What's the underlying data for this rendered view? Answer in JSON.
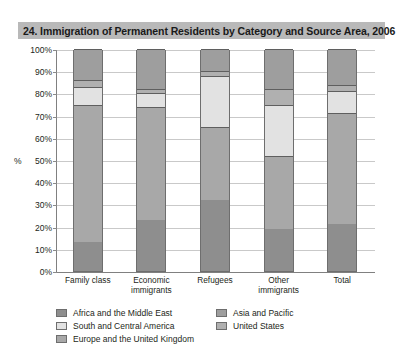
{
  "title": "24. Immigration of Permanent Residents by Category and Source Area, 2006",
  "axis": {
    "unit_label": "%",
    "y_ticks": [
      "100%",
      "90%",
      "80%",
      "70%",
      "60%",
      "50%",
      "40%",
      "30%",
      "20%",
      "10%",
      "0%"
    ]
  },
  "legend": {
    "items": [
      {
        "label": "Africa and the Middle East",
        "color": "#8e8e8e"
      },
      {
        "label": "Asia and Pacific",
        "color": "#9e9e9e"
      },
      {
        "label": "South and Central America",
        "color": "#e2e2e2"
      },
      {
        "label": "United States",
        "color": "#b0b0b0"
      },
      {
        "label": "Europe and the United Kingdom",
        "color": "#a8a8a8"
      }
    ]
  },
  "chart_data": {
    "type": "bar",
    "stacked": true,
    "stack_total": 100,
    "title": "24. Immigration of Permanent Residents by Category and Source Area, 2006",
    "xlabel": "",
    "ylabel": "%",
    "ylim": [
      0,
      100
    ],
    "grid": true,
    "legend_position": "bottom",
    "categories": [
      "Family class",
      "Economic immigrants",
      "Refugees",
      "Other immigrants",
      "Total"
    ],
    "series": [
      {
        "name": "Africa and the Middle East",
        "color": "#8e8e8e",
        "values": [
          13,
          23,
          32,
          19,
          21
        ]
      },
      {
        "name": "Europe and the United Kingdom",
        "color": "#a8a8a8",
        "values": [
          62,
          51,
          33,
          33,
          50
        ]
      },
      {
        "name": "South and Central America",
        "color": "#e2e2e2",
        "values": [
          8,
          6,
          23,
          23,
          10
        ]
      },
      {
        "name": "United States",
        "color": "#b0b0b0",
        "values": [
          3,
          2,
          2,
          7,
          3
        ]
      },
      {
        "name": "Asia and Pacific",
        "color": "#9e9e9e",
        "values": [
          14,
          18,
          10,
          18,
          16
        ]
      }
    ]
  }
}
